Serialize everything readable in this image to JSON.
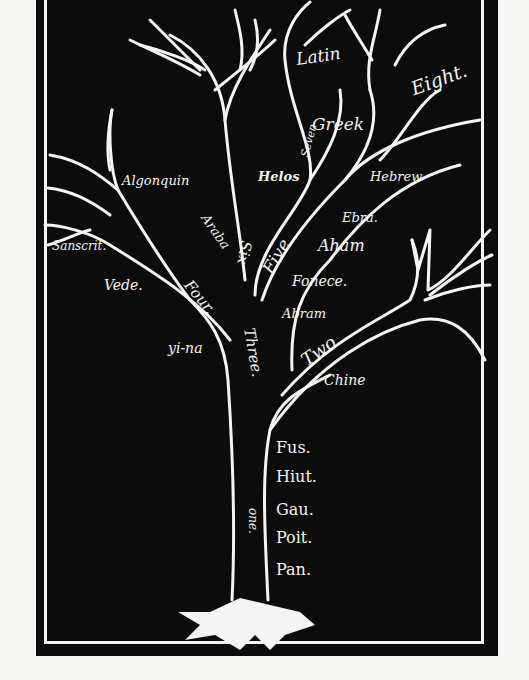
{
  "diagram": {
    "type": "language-family-tree",
    "colors": {
      "background": "#0c0c0c",
      "lines": "#f4f4f4",
      "page": "#f7f7f5"
    },
    "branches": {
      "one": "one.",
      "two": "Two",
      "three": "Three.",
      "four": "Four.",
      "five": "Five",
      "six": "Six",
      "seven": "Seven",
      "eight": "Eight."
    },
    "languages": {
      "latin": "Latin",
      "greek": "Greek",
      "helos": "Helos",
      "algonquin": "Algonquin",
      "hebrew": "Hebrew",
      "ebra": "Ebra.",
      "aham": "Aham",
      "fonece": "Fonece.",
      "abram": "Abram",
      "sanscrit": "Sanscrit.",
      "vede": "Vede.",
      "araba": "Araba",
      "yi_na": "yi-na",
      "chine": "Chine",
      "fus": "Fus.",
      "hiut": "Hiut.",
      "gau": "Gau.",
      "poit": "Poit.",
      "pan": "Pan."
    }
  }
}
